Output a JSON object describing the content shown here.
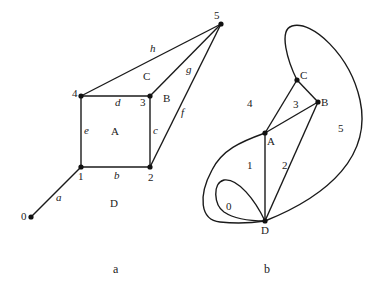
{
  "figure_a": {
    "caption": "a",
    "nodes": [
      {
        "id": "0",
        "label": "0",
        "x": 31,
        "y": 217
      },
      {
        "id": "1",
        "label": "1",
        "x": 81,
        "y": 167
      },
      {
        "id": "2",
        "label": "2",
        "x": 150,
        "y": 167
      },
      {
        "id": "3",
        "label": "3",
        "x": 150,
        "y": 96
      },
      {
        "id": "4",
        "label": "4",
        "x": 81,
        "y": 96
      },
      {
        "id": "5",
        "label": "5",
        "x": 221,
        "y": 24
      }
    ],
    "edges": [
      {
        "label": "a",
        "from": "0",
        "to": "1"
      },
      {
        "label": "b",
        "from": "1",
        "to": "2"
      },
      {
        "label": "c",
        "from": "2",
        "to": "3"
      },
      {
        "label": "d",
        "from": "3",
        "to": "4"
      },
      {
        "label": "e",
        "from": "4",
        "to": "1"
      },
      {
        "label": "f",
        "from": "2",
        "to": "5"
      },
      {
        "label": "g",
        "from": "3",
        "to": "5"
      },
      {
        "label": "h",
        "from": "4",
        "to": "5"
      }
    ],
    "faces": [
      "A",
      "B",
      "C",
      "D"
    ]
  },
  "figure_b": {
    "caption": "b",
    "nodes": [
      {
        "id": "A",
        "label": "A",
        "x": 265,
        "y": 133
      },
      {
        "id": "B",
        "label": "B",
        "x": 318,
        "y": 102
      },
      {
        "id": "C",
        "label": "C",
        "x": 297,
        "y": 80
      },
      {
        "id": "D",
        "label": "D",
        "x": 265,
        "y": 221
      }
    ],
    "faces": [
      "0",
      "1",
      "2",
      "3",
      "4",
      "5"
    ]
  }
}
